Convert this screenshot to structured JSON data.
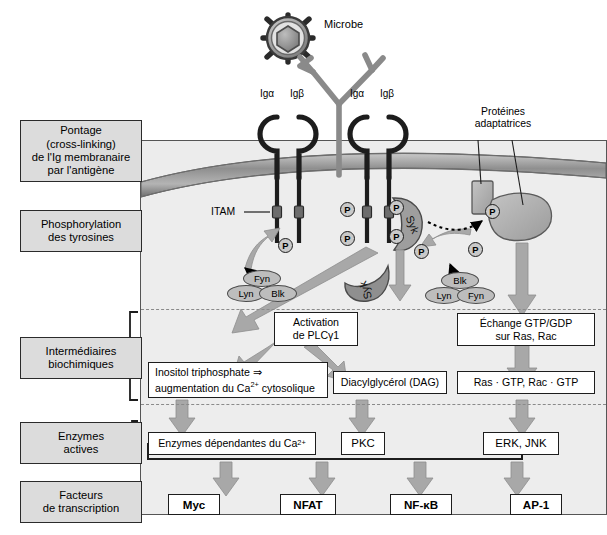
{
  "stages": [
    {
      "id": "pontage",
      "lines": [
        "Pontage",
        "(cross-linking)",
        "de l'Ig membranaire",
        "par l'antigène"
      ]
    },
    {
      "id": "phosphorylation",
      "lines": [
        "Phosphorylation",
        "des tyrosines"
      ]
    },
    {
      "id": "intermediaires",
      "lines": [
        "Intermédiaires",
        "biochimiques"
      ]
    },
    {
      "id": "enzymes",
      "lines": [
        "Enzymes",
        "actives"
      ]
    },
    {
      "id": "facteurs",
      "lines": [
        "Facteurs",
        "de transcription"
      ]
    }
  ],
  "top": {
    "microbe_label": "Microbe",
    "receptor_labels": [
      "Igα",
      "Igβ",
      "Igα",
      "Igβ"
    ],
    "adaptor_label_lines": [
      "Protéines",
      "adaptatrices"
    ],
    "itam_label": "ITAM"
  },
  "kinases": {
    "left_group": [
      "Fyn",
      "Lyn",
      "Blk"
    ],
    "right_group": [
      "Blk",
      "Lyn",
      "Fyn"
    ],
    "syk_bound": "Syk",
    "syk_free": "Syk"
  },
  "phosphate_symbol": "P",
  "intermediates": {
    "plc": "Activation\nde PLCγ1",
    "plc_line1": "Activation",
    "plc_line2": "de PLCγ1",
    "ip3_line1": "Inositol triphosphate ⇒",
    "ip3_line2_a": "augmentation du Ca",
    "ip3_line2_sup": "2+",
    "ip3_line2_b": " cytosolique",
    "dag": "Diacylglycérol (DAG)",
    "gtp_exchange_line1": "Échange GTP/GDP",
    "gtp_exchange_line2": "sur Ras, Rac",
    "ras_gtp": "Ras · GTP, Rac · GTP"
  },
  "enzymes": {
    "ca_dependent_a": "Enzymes dépendantes du Ca",
    "ca_dependent_sup": "2+",
    "pkc": "PKC",
    "erk_jnk": "ERK, JNK"
  },
  "transcription_factors": [
    "Myc",
    "NFAT",
    "NF-κB",
    "AP-1"
  ],
  "colors": {
    "stage_fill": "#dcdcdc",
    "cell_fill": "#ededed",
    "membrane": "#9a9a9a",
    "arrow_gray": "#a8a8a8",
    "kinase_fill": "#bdbdbd",
    "outline": "#1d1d1d"
  }
}
